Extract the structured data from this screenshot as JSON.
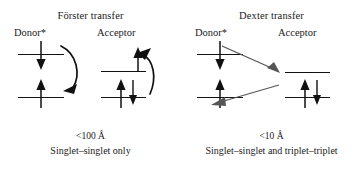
{
  "figure": {
    "type": "diagram",
    "background_color": "#ffffff",
    "line_color": "#111111",
    "thin_arrow_color": "#555555"
  },
  "panels": [
    {
      "id": "forster",
      "title": "Förster transfer",
      "donor_label": "Donor*",
      "acceptor_label": "Acceptor",
      "distance_caption": "<100 Å",
      "rule_caption": "Singlet–singlet only",
      "mechanism": "coulombic-dipole-dipole",
      "donor": {
        "levels": [
          {
            "name": "donor-excited-level",
            "occupancy": "down-spin"
          },
          {
            "name": "donor-ground-level",
            "occupancy": "up-spin"
          }
        ]
      },
      "acceptor": {
        "levels": [
          {
            "name": "acceptor-excited-level",
            "occupancy": "up-spin-arriving"
          },
          {
            "name": "acceptor-ground-level",
            "occupancy": "up-spin-and-down-spin"
          }
        ]
      },
      "transfer_arrows": [
        {
          "name": "donor-relaxation-arrow",
          "style": "curved-thick"
        },
        {
          "name": "acceptor-excitation-arrow",
          "style": "curved-thick"
        }
      ]
    },
    {
      "id": "dexter",
      "title": "Dexter transfer",
      "donor_label": "Donor*",
      "acceptor_label": "Acceptor",
      "distance_caption": "<10 Å",
      "rule_caption": "Singlet–singlet and triplet–triplet",
      "mechanism": "double-electron-exchange",
      "donor": {
        "levels": [
          {
            "name": "donor-excited-level",
            "occupancy": "down-spin"
          },
          {
            "name": "donor-ground-level",
            "occupancy": "up-spin-arriving"
          }
        ]
      },
      "acceptor": {
        "levels": [
          {
            "name": "acceptor-excited-level",
            "occupancy": "empty"
          },
          {
            "name": "acceptor-ground-level",
            "occupancy": "up-spin-and-down-spin"
          }
        ]
      },
      "transfer_arrows": [
        {
          "name": "electron-exchange-arrow-to-acceptor",
          "style": "straight-thin-diagonal",
          "direction": "down-right"
        },
        {
          "name": "electron-exchange-arrow-to-donor",
          "style": "straight-thin-diagonal",
          "direction": "left"
        }
      ]
    }
  ]
}
